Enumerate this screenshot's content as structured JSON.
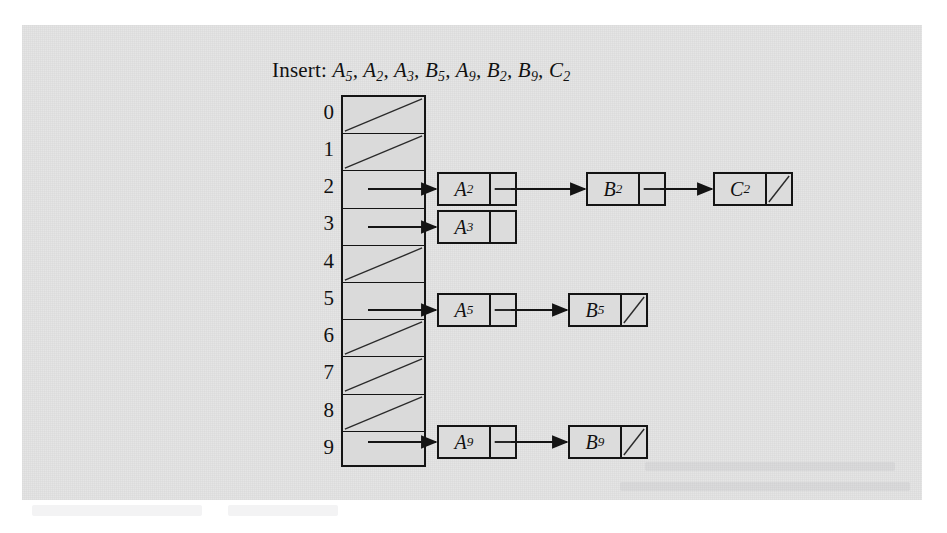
{
  "figure": {
    "title_prefix": "Insert:",
    "title_items": [
      "A5",
      "A2",
      "A3",
      "B5",
      "A9",
      "B2",
      "B9",
      "C2"
    ],
    "title_full": "Insert: A5, A2, A3, B5, A9, B2, B9, C2",
    "colors": {
      "paper": "#e3e3e3",
      "cell_fill": "#dadada",
      "node_fill": "#dcdcdc",
      "ink": "#141414",
      "text": "#111111"
    }
  },
  "hash_table": {
    "index_labels": [
      "0",
      "1",
      "2",
      "3",
      "4",
      "5",
      "6",
      "7",
      "8",
      "9"
    ],
    "buckets": [
      {
        "index": "0",
        "state": "null"
      },
      {
        "index": "1",
        "state": "null"
      },
      {
        "index": "2",
        "state": "pointer"
      },
      {
        "index": "3",
        "state": "pointer"
      },
      {
        "index": "4",
        "state": "null"
      },
      {
        "index": "5",
        "state": "pointer"
      },
      {
        "index": "6",
        "state": "null"
      },
      {
        "index": "7",
        "state": "null"
      },
      {
        "index": "8",
        "state": "null"
      },
      {
        "index": "9",
        "state": "pointer"
      }
    ]
  },
  "chains": [
    {
      "bucket": "2",
      "nodes": [
        {
          "letter": "A",
          "sub": "2",
          "next": "pointer"
        },
        {
          "letter": "B",
          "sub": "2",
          "next": "pointer"
        },
        {
          "letter": "C",
          "sub": "2",
          "next": "null"
        }
      ]
    },
    {
      "bucket": "3",
      "nodes": [
        {
          "letter": "A",
          "sub": "3",
          "next": "empty"
        }
      ]
    },
    {
      "bucket": "5",
      "nodes": [
        {
          "letter": "A",
          "sub": "5",
          "next": "pointer"
        },
        {
          "letter": "B",
          "sub": "5",
          "next": "null"
        }
      ]
    },
    {
      "bucket": "9",
      "nodes": [
        {
          "letter": "A",
          "sub": "9",
          "next": "pointer"
        },
        {
          "letter": "B",
          "sub": "9",
          "next": "null"
        }
      ]
    }
  ]
}
